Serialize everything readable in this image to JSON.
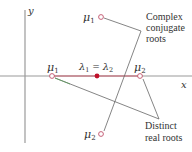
{
  "diagram": {
    "axes": {
      "x_label": "x",
      "y_label": "y",
      "axis_color": "#9a9a9a"
    },
    "points": {
      "complex_mu1": {
        "label": "μ",
        "sub": "1",
        "kind": "open",
        "x": 101,
        "y": 17
      },
      "complex_mu2": {
        "label": "μ",
        "sub": "2",
        "kind": "open",
        "x": 101,
        "y": 134
      },
      "repeated_lambda": {
        "label": "λ",
        "sub1": "1",
        "eq": " = ",
        "label2": "λ",
        "sub2": "2",
        "kind": "filled",
        "x": 97,
        "y": 76
      },
      "real_mu1": {
        "label": "μ",
        "sub": "1",
        "kind": "open",
        "x": 52,
        "y": 76
      },
      "real_mu2": {
        "label": "μ",
        "sub": "2",
        "kind": "open",
        "x": 140,
        "y": 76
      }
    },
    "annotations": {
      "complex": {
        "lines": [
          "Complex",
          "conjugate",
          "roots"
        ]
      },
      "real": {
        "lines": [
          "Distinct",
          "real roots"
        ]
      }
    },
    "colors": {
      "point": "#c0506a",
      "filled_point": "#c0102a",
      "leader_line": "#666666",
      "real_axis_segment": "#c0102a",
      "text": "#333333"
    }
  }
}
